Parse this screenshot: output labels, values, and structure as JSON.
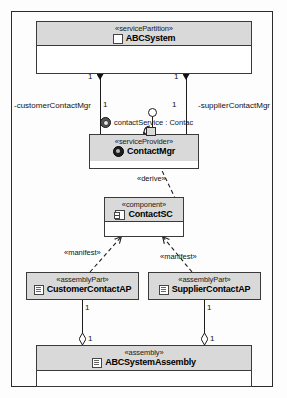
{
  "diagram": {
    "type": "uml-component-diagram",
    "border_color": "#2b2b2b",
    "header_fill": "#d9d9d9",
    "line_color": "#1d1d1d"
  },
  "nodes": {
    "abcsystem": {
      "stereotype": "«servicePartition»",
      "name": "ABCSystem",
      "icon": "class-icon"
    },
    "contactmgr": {
      "stereotype": "«serviceProvider»",
      "name": "ContactMgr",
      "icon": "service-provider-icon"
    },
    "contactsc": {
      "stereotype": "«component»",
      "name": "ContactSC",
      "icon": "component-icon"
    },
    "customercontactap": {
      "stereotype": "«assemblyPart»",
      "name": "CustomerContactAP",
      "icon": "artifact-icon"
    },
    "suppliercontactap": {
      "stereotype": "«assemblyPart»",
      "name": "SupplierContactAP",
      "icon": "artifact-icon"
    },
    "abcsystemassembly": {
      "stereotype": "«assembly»",
      "name": "ABCSystemAssembly",
      "icon": "artifact-icon"
    }
  },
  "interface": {
    "icon": "interface-ball-icon",
    "label": "contactService : Contac"
  },
  "roles": {
    "customer": "-customerContactMgr",
    "supplier": "-supplierContactMgr"
  },
  "multiplicities": {
    "comp_left_top": "1",
    "comp_left_bottom": "1",
    "comp_right_top": "1",
    "comp_right_bottom": "1",
    "agg_left_top": "1",
    "agg_left_bottom": "1",
    "agg_right_top": "1",
    "agg_right_bottom": "1"
  },
  "edges": {
    "derive": "«derive»",
    "manifest_left": "«manifest»",
    "manifest_right": "«manifest»"
  }
}
